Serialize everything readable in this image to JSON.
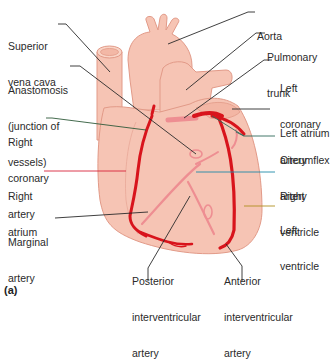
{
  "figure": {
    "panel_label": "(a)",
    "colors": {
      "heart_fill": "#f6c4b4",
      "heart_outline": "#e29a88",
      "artery": "#d8141c",
      "artery_light": "#ee8e92",
      "leader_default": "#2a2a2a",
      "leader_right_atrium": "#d8243a",
      "leader_right_coronary": "#2f5a3a",
      "leader_circumflex": "#2f6a5a",
      "leader_right_ventricle": "#1f8aa8",
      "leader_left_ventricle": "#b09020"
    }
  },
  "labels": {
    "superior_vena_cava": {
      "line1": "Superior",
      "line2": "vena cava"
    },
    "anastomosis": {
      "line1": "Anastomosis",
      "line2": "(junction of",
      "line3": "vessels)"
    },
    "right_coronary_artery": {
      "line1": "Right",
      "line2": "coronary",
      "line3": "artery"
    },
    "right_atrium": {
      "line1": "Right",
      "line2": "atrium"
    },
    "marginal_artery": {
      "line1": "Marginal",
      "line2": "artery"
    },
    "posterior_interventricular_artery": {
      "line1": "Posterior",
      "line2": "interventricular",
      "line3": "artery"
    },
    "anterior_interventricular_artery": {
      "line1": "Anterior",
      "line2": "interventricular",
      "line3": "artery"
    },
    "aorta": {
      "line1": "Aorta"
    },
    "pulmonary_trunk": {
      "line1": "Pulmonary",
      "line2": "trunk"
    },
    "left_coronary_artery": {
      "line1": "Left",
      "line2": "coronary",
      "line3": "artery"
    },
    "left_atrium": {
      "line1": "Left atrium"
    },
    "circumflex_artery": {
      "line1": "Circumflex",
      "line2": "artery"
    },
    "right_ventricle": {
      "line1": "Right",
      "line2": "ventricle"
    },
    "left_ventricle": {
      "line1": "Left",
      "line2": "ventricle"
    }
  }
}
